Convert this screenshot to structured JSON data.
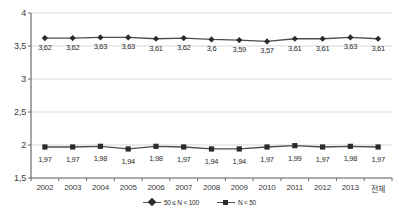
{
  "chart_data": {
    "type": "line",
    "title": "",
    "subtitle": "",
    "xlabel": "",
    "ylabel": "",
    "ylim": [
      1.5,
      4
    ],
    "grid": true,
    "legend_position": "bottom",
    "decimal_separator": ",",
    "categories": [
      "2002",
      "2003",
      "2004",
      "2005",
      "2006",
      "2007",
      "2008",
      "2009",
      "2010",
      "2011",
      "2012",
      "2013",
      "전체"
    ],
    "y_ticks": [
      1.5,
      2,
      2.5,
      3,
      3.5,
      4
    ],
    "y_tick_labels": [
      "1,5",
      "2",
      "2,5",
      "3",
      "3,5",
      "4"
    ],
    "series": [
      {
        "name": "50 ≤ N < 100",
        "marker": "diamond",
        "color": "#2b2b2b",
        "values": [
          3.62,
          3.62,
          3.63,
          3.63,
          3.61,
          3.62,
          3.6,
          3.59,
          3.57,
          3.61,
          3.61,
          3.63,
          3.61
        ],
        "labels": [
          "3,62",
          "3,62",
          "3,63",
          "3,63",
          "3,61",
          "3,62",
          "3,6",
          "3,59",
          "3,57",
          "3,61",
          "3,61",
          "3,63",
          "3,61"
        ]
      },
      {
        "name": "N < 50",
        "marker": "square",
        "color": "#2b2b2b",
        "values": [
          1.97,
          1.97,
          1.98,
          1.94,
          1.98,
          1.97,
          1.94,
          1.94,
          1.97,
          1.99,
          1.97,
          1.98,
          1.97
        ],
        "labels": [
          "1,97",
          "1,97",
          "1,98",
          "1,94",
          "1,98",
          "1,97",
          "1,94",
          "1,94",
          "1,97",
          "1,99",
          "1,97",
          "1,98",
          "1,97"
        ]
      }
    ]
  },
  "colors": {
    "axis": "#6b6b6b",
    "grid": "#d9d9d9",
    "line": "#4d4d4d",
    "marker": "#2b2b2b",
    "text": "#2b2b2b",
    "background": "#ffffff"
  }
}
